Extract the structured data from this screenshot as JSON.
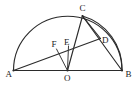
{
  "figure": {
    "kind": "geometry-diagram",
    "background_color": "#ffffff",
    "line_color": "#2b2b2b",
    "label_color": "#1a1a1a",
    "width": 137,
    "height": 85
  },
  "points": [
    {
      "id": "A",
      "label": "A",
      "x": 13.5,
      "y": 70.5,
      "label_x": 5.5,
      "label_y": 76.5
    },
    {
      "id": "B",
      "label": "B",
      "x": 122.0,
      "y": 70.5,
      "label_x": 125.5,
      "label_y": 77.0
    },
    {
      "id": "O",
      "label": "O",
      "x": 67.5,
      "y": 70.5,
      "label_x": 64.0,
      "label_y": 81.0
    },
    {
      "id": "C",
      "label": "C",
      "x": 82.5,
      "y": 16.0,
      "label_x": 79.5,
      "label_y": 11.0
    },
    {
      "id": "D",
      "label": "D",
      "x": 100.5,
      "y": 38.5,
      "label_x": 102.0,
      "label_y": 43.0
    },
    {
      "id": "E",
      "label": "E",
      "x": 68.5,
      "y": 46.0,
      "label_x": 64.0,
      "label_y": 44.5
    },
    {
      "id": "F",
      "label": "F",
      "x": 56.5,
      "y": 49.0,
      "label_x": 51.5,
      "label_y": 47.0
    }
  ],
  "segments": [
    {
      "id": "AB",
      "from": "A",
      "to": "B",
      "name": "diameter-segment-ab"
    },
    {
      "id": "AD",
      "from": "A",
      "to": "D",
      "name": "segment-ad"
    },
    {
      "id": "CO",
      "from": "C",
      "to": "O",
      "name": "segment-co"
    },
    {
      "id": "CB",
      "from": "C",
      "to": "B",
      "name": "segment-cb"
    },
    {
      "id": "CD",
      "from": "C",
      "to": "D",
      "name": "segment-cd"
    },
    {
      "id": "OF",
      "from": "O",
      "to": "F",
      "name": "segment-of"
    },
    {
      "id": "OE",
      "from": "O",
      "to": "E",
      "name": "segment-oe"
    }
  ],
  "arcs": [
    {
      "id": "semicircle-AB",
      "name": "semicircle-arc-ab",
      "path": "M 13.5 70.5 A 54.25 54.25 0 0 1 122 70.5",
      "description": "Main semicircle from A over top to B, center O"
    },
    {
      "id": "arc-CB",
      "name": "minor-arc-cb",
      "path": "M 82.5 16 A 55 55 0 0 1 122 70.5",
      "description": "Smaller arc from C through D region down to B"
    }
  ],
  "vertex_dots": [
    "A",
    "B",
    "O",
    "C"
  ]
}
